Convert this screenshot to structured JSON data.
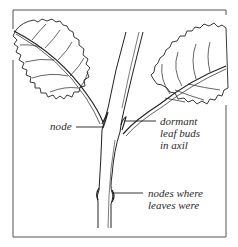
{
  "figure": {
    "title": "",
    "frame_color": "#555555",
    "ink_color": "#222222",
    "background": "#ffffff"
  },
  "labels": {
    "node": "node",
    "dormant": {
      "lines": [
        "dormant",
        "leaf buds",
        "in axil"
      ]
    },
    "nodes_where": {
      "lines": [
        "nodes where",
        "leaves were"
      ]
    }
  },
  "parts": {
    "stem": "stem",
    "left_leaf": "left leaf",
    "right_leaf": "right leaf"
  }
}
